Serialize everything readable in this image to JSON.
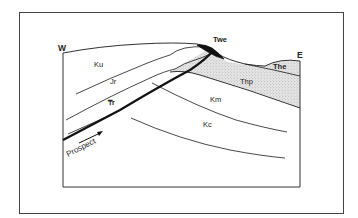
{
  "diagram": {
    "type": "geologic-cross-section",
    "orientation": {
      "west_label": "W",
      "east_label": "E"
    },
    "fault": {
      "label": "Prospect",
      "arrow": "thrust-direction-arrow"
    },
    "units": [
      {
        "id": "Ku",
        "label": "Ku"
      },
      {
        "id": "Jr",
        "label": "Jr"
      },
      {
        "id": "Tr",
        "label": "₸r"
      },
      {
        "id": "Twe",
        "label": "Twe"
      },
      {
        "id": "The",
        "label": "The"
      },
      {
        "id": "Thp",
        "label": "Thp"
      },
      {
        "id": "Km",
        "label": "Km"
      },
      {
        "id": "Kc",
        "label": "Kc"
      }
    ],
    "colors": {
      "line": "#1a1a1a",
      "frame": "#444444",
      "stipple_bg": "#e4e4e4",
      "stipple_dot": "#9a9a9a",
      "twe_fill": "#111111"
    }
  }
}
